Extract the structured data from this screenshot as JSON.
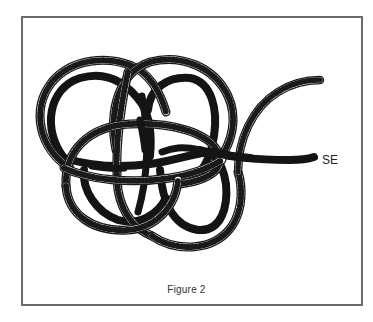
{
  "figure": {
    "caption": "Figure 2",
    "label_end": "SE",
    "colors": {
      "border": "#6a6a6a",
      "rope_light_fill": "#ffffff",
      "rope_outline": "#1a1a1a",
      "rope_dark": "#141414",
      "background": "#ffffff"
    }
  }
}
